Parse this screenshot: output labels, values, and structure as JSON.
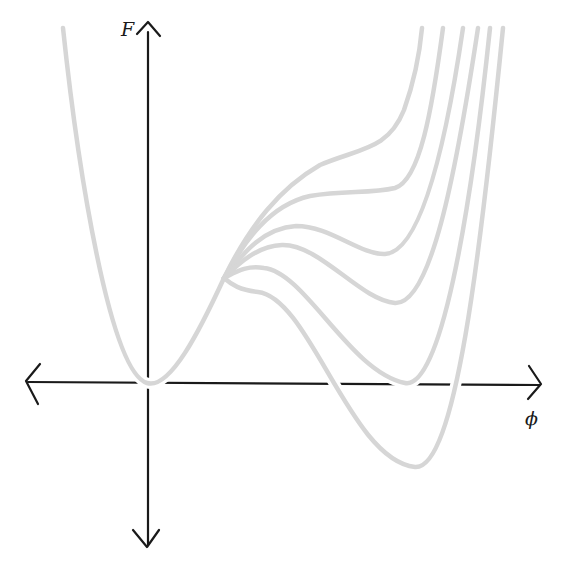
{
  "diagram": {
    "title": "",
    "axes": {
      "y_label": "F",
      "x_label": "ϕ",
      "y_axis_x": 148,
      "x_axis_y": 383
    },
    "colors": {
      "axis": "#1a1a1a",
      "curve": "#d6d6d6",
      "background": "#ffffff"
    },
    "curves": [
      {
        "name": "curve-1",
        "description": "single minimum at origin with inflection shoulder",
        "path": "M224,278 C250,225 280,188 320,165 C360,148 388,150 404,110 C414,82 420,50 422,28"
      },
      {
        "name": "curve-2",
        "description": "flat shoulder, marginal second minimum",
        "path": "M224,278 C245,240 270,205 310,196 C345,190 370,194 395,188 C420,180 432,110 443,28"
      },
      {
        "name": "curve-3",
        "description": "metastable local minimum, high",
        "path": "M224,278 C245,250 265,228 296,226 C330,226 360,255 385,254 C420,252 445,150 463,28"
      },
      {
        "name": "curve-4",
        "description": "metastable local minimum, medium",
        "path": "M224,278 C240,262 258,246 282,245 C320,244 360,300 395,303 C430,305 455,180 478,28"
      },
      {
        "name": "curve-5",
        "description": "degenerate minima (coexistence)",
        "path": "M224,278 C236,272 246,265 264,268 C305,272 350,372 405,383 C440,390 470,220 490,28"
      },
      {
        "name": "curve-6",
        "description": "stable second minimum below zero",
        "path": "M224,278 C232,285 240,290 258,292 C310,298 350,460 415,467 C455,470 480,260 503,28"
      }
    ],
    "shared_left_branch": "M63,28 C78,170 110,372 147,383 C170,390 200,330 224,278",
    "chart_data": {
      "type": "line",
      "title": "",
      "xlabel": "ϕ",
      "ylabel": "F",
      "grid": false,
      "legend": "none",
      "notes": "Schematic free energy F(ϕ) curves (Landau theory of first-order transition); six curves sharing a minimum at ϕ=0, F=0, with a second well that deepens progressively: shoulder only, flat shoulder, shallow metastable, deeper metastable, degenerate (F=0), and stable (F<0).",
      "series": [
        {
          "name": "curve-1",
          "second_minimum": "none (inflection)"
        },
        {
          "name": "curve-2",
          "second_minimum": "marginal / flat"
        },
        {
          "name": "curve-3",
          "second_minimum": "metastable, F>0 (high)"
        },
        {
          "name": "curve-4",
          "second_minimum": "metastable, F>0 (lower)"
        },
        {
          "name": "curve-5",
          "second_minimum": "F=0 (degenerate with origin)"
        },
        {
          "name": "curve-6",
          "second_minimum": "F<0 (global minimum)"
        }
      ]
    }
  }
}
